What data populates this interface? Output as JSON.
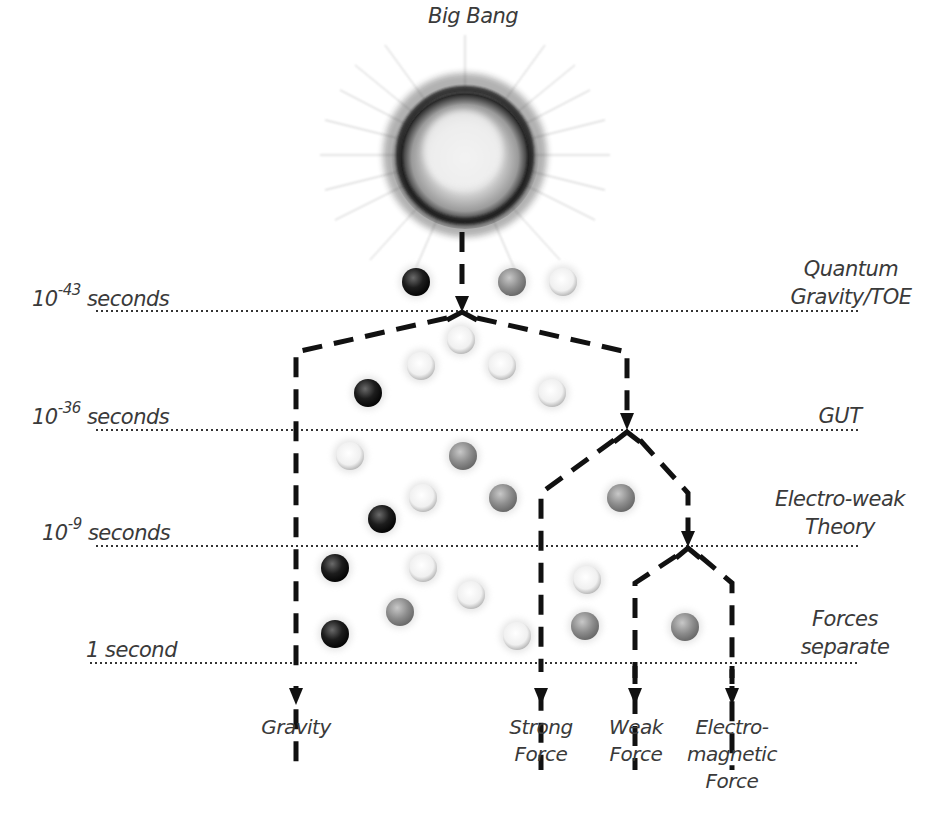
{
  "title": "Big Bang",
  "time_markers": [
    {
      "base": "10",
      "exp": "-43",
      "unit": "seconds",
      "y": 311
    },
    {
      "base": "10",
      "exp": "-36",
      "unit": "seconds",
      "y": 430
    },
    {
      "base": "10",
      "exp": "-9",
      "unit": "seconds",
      "y": 546
    },
    {
      "base": "1",
      "exp": "",
      "unit": "second",
      "y": 663
    }
  ],
  "eras": [
    {
      "line1": "Quantum",
      "line2": "Gravity/TOE"
    },
    {
      "line1": "GUT",
      "line2": ""
    },
    {
      "line1": "Electro-weak",
      "line2": "Theory"
    },
    {
      "line1": "Forces",
      "line2": "separate"
    }
  ],
  "forces": [
    {
      "line1": "Gravity",
      "line2": "",
      "line3": ""
    },
    {
      "line1": "Strong",
      "line2": "Force",
      "line3": ""
    },
    {
      "line1": "Weak",
      "line2": "Force",
      "line3": ""
    },
    {
      "line1": "Electro-",
      "line2": "magnetic",
      "line3": "Force"
    }
  ],
  "colors": {
    "text": "#3a3a3a",
    "dashed_line": "#111111",
    "dotted_line": "#333333",
    "particle_dark": "#1a1a1a",
    "particle_mid": "#8a8a8a",
    "particle_light": "#e8e8e8"
  },
  "particles": [
    {
      "x": 416,
      "y": 282,
      "tone": "dark"
    },
    {
      "x": 512,
      "y": 282,
      "tone": "mid"
    },
    {
      "x": 563,
      "y": 282,
      "tone": "light"
    },
    {
      "x": 461,
      "y": 340,
      "tone": "light"
    },
    {
      "x": 421,
      "y": 366,
      "tone": "light"
    },
    {
      "x": 502,
      "y": 366,
      "tone": "light"
    },
    {
      "x": 368,
      "y": 393,
      "tone": "dark"
    },
    {
      "x": 552,
      "y": 393,
      "tone": "light"
    },
    {
      "x": 350,
      "y": 456,
      "tone": "light"
    },
    {
      "x": 463,
      "y": 456,
      "tone": "mid"
    },
    {
      "x": 423,
      "y": 498,
      "tone": "light"
    },
    {
      "x": 503,
      "y": 498,
      "tone": "mid"
    },
    {
      "x": 621,
      "y": 498,
      "tone": "mid"
    },
    {
      "x": 382,
      "y": 519,
      "tone": "dark"
    },
    {
      "x": 335,
      "y": 568,
      "tone": "dark"
    },
    {
      "x": 423,
      "y": 568,
      "tone": "light"
    },
    {
      "x": 471,
      "y": 595,
      "tone": "light"
    },
    {
      "x": 587,
      "y": 580,
      "tone": "light"
    },
    {
      "x": 400,
      "y": 612,
      "tone": "mid"
    },
    {
      "x": 335,
      "y": 634,
      "tone": "dark"
    },
    {
      "x": 517,
      "y": 636,
      "tone": "light"
    },
    {
      "x": 585,
      "y": 626,
      "tone": "mid"
    },
    {
      "x": 685,
      "y": 627,
      "tone": "mid"
    }
  ]
}
